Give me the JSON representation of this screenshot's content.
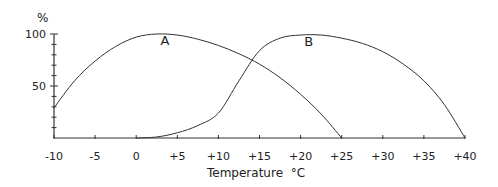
{
  "chart_data": {
    "type": "line",
    "title": "",
    "xlabel": "Temperature °C",
    "ylabel": "%",
    "xlim": [
      -10,
      40
    ],
    "ylim": [
      0,
      100
    ],
    "x_ticks": [
      -10,
      -5,
      0,
      5,
      10,
      15,
      20,
      25,
      30,
      35,
      40
    ],
    "x_tick_labels": [
      "-10",
      "-5",
      "0",
      "+5",
      "+10",
      "+15",
      "+20",
      "+25",
      "+30",
      "+35",
      "+40"
    ],
    "y_ticks_labeled": [
      50,
      100
    ],
    "y_tick_labels": [
      "50",
      "100"
    ],
    "y_minor_tick_step": 10,
    "grid": false,
    "legend": "none (curves labeled inline)",
    "series": [
      {
        "name": "A",
        "x": [
          -10,
          -7.5,
          -5,
          -2.5,
          0,
          2.5,
          5,
          7.5,
          10,
          12.5,
          15,
          17.5,
          20,
          22.5,
          25
        ],
        "values": [
          29,
          55,
          74,
          88,
          97,
          100,
          99,
          95,
          89,
          81,
          71,
          58,
          42,
          23,
          0
        ]
      },
      {
        "name": "B",
        "x": [
          0,
          2.5,
          5,
          7.5,
          10,
          12.5,
          15,
          17.5,
          20,
          22.5,
          25,
          27.5,
          30,
          32.5,
          35,
          37.5,
          40
        ],
        "values": [
          0,
          1,
          5,
          12,
          24,
          55,
          84,
          96,
          99,
          99,
          96,
          91,
          83,
          71,
          55,
          32,
          0
        ]
      }
    ],
    "annotations": [
      {
        "text": "A",
        "x": 3.5,
        "y": 89
      },
      {
        "text": "B",
        "x": 21,
        "y": 88
      }
    ]
  },
  "axis": {
    "y_unit_label": "%",
    "x_title": "Temperature  °C"
  }
}
